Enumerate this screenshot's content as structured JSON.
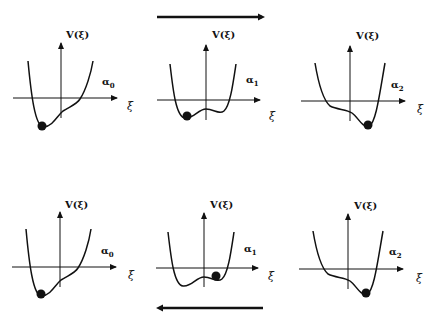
{
  "diagram": {
    "axis_labels": {
      "y": "V(ξ)",
      "x": "ξ"
    },
    "arrows": [
      {
        "position": "top",
        "direction": "right"
      },
      {
        "position": "bottom",
        "direction": "left"
      }
    ],
    "panels": [
      {
        "row": "top",
        "param": "α",
        "sub": "0",
        "ball": "left minimum"
      },
      {
        "row": "top",
        "param": "α",
        "sub": "1",
        "ball": "left well"
      },
      {
        "row": "top",
        "param": "α",
        "sub": "2",
        "ball": "right minimum"
      },
      {
        "row": "bottom",
        "param": "α",
        "sub": "0",
        "ball": "left minimum"
      },
      {
        "row": "bottom",
        "param": "α",
        "sub": "1",
        "ball": "right well"
      },
      {
        "row": "bottom",
        "param": "α",
        "sub": "2",
        "ball": "right minimum"
      }
    ],
    "colors": {
      "ink": "#111111",
      "background": "#ffffff"
    }
  }
}
